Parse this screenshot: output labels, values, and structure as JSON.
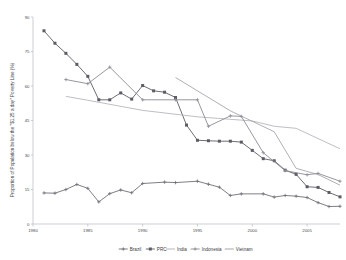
{
  "chart_data": {
    "type": "line",
    "title": "",
    "xlabel": "",
    "ylabel": "Proportion of Population below the \"$1.25 a day\" Poverty Line (%)",
    "xlim": [
      1980,
      2008
    ],
    "ylim": [
      0,
      90
    ],
    "xticks": [
      "1980",
      "1985",
      "1990",
      "1995",
      "2000",
      "2005"
    ],
    "xtick_values": [
      1980,
      1985,
      1990,
      1995,
      2000,
      2005
    ],
    "yticks": [
      "0",
      "15",
      "30",
      "45",
      "60",
      "75",
      "90"
    ],
    "ytick_values": [
      0,
      15,
      30,
      45,
      60,
      75,
      90
    ],
    "grid": false,
    "legend_position": "bottom",
    "series": [
      {
        "name": "Brazil",
        "color": "#6f6f78",
        "marker": "plus",
        "x": [
          1981,
          1982,
          1983,
          1984,
          1985,
          1986,
          1987,
          1988,
          1989,
          1990,
          1992,
          1993,
          1995,
          1996,
          1997,
          1998,
          1999,
          2001,
          2002,
          2003,
          2004,
          2005,
          2006,
          2007,
          2008
        ],
        "y": [
          13.5,
          13.4,
          15.0,
          17.2,
          15.5,
          9.6,
          13.2,
          14.8,
          13.6,
          17.6,
          18.2,
          18.0,
          18.6,
          17.3,
          16.0,
          12.4,
          13.1,
          13.1,
          11.7,
          12.4,
          12.1,
          11.5,
          9.3,
          7.6,
          7.7
        ]
      },
      {
        "name": "PRC",
        "color": "#5c5c66",
        "marker": "square",
        "x": [
          1981,
          1982,
          1983,
          1984,
          1985,
          1986,
          1987,
          1988,
          1989,
          1990,
          1991,
          1992,
          1993,
          1994,
          1995,
          1996,
          1997,
          1998,
          1999,
          2000,
          2001,
          2002,
          2003,
          2004,
          2005,
          2006,
          2007,
          2008
        ],
        "y": [
          84.0,
          78.6,
          74.2,
          69.4,
          64.2,
          54.0,
          54.0,
          57.0,
          54.3,
          60.2,
          57.9,
          57.3,
          55.0,
          43.0,
          36.4,
          36.2,
          36.0,
          36.0,
          35.6,
          32.0,
          28.4,
          27.5,
          23.4,
          21.6,
          16.2,
          15.9,
          13.7,
          11.8
        ]
      },
      {
        "name": "India",
        "color": "#adadb6",
        "marker": "none",
        "x": [
          1983,
          1985,
          1990,
          1995,
          2000,
          2002,
          2004,
          2008
        ],
        "y": [
          55.5,
          53.8,
          49.4,
          46.6,
          44.8,
          42.5,
          41.6,
          32.7
        ]
      },
      {
        "name": "Indonesia",
        "color": "#8b8b95",
        "marker": "plus",
        "x": [
          1983,
          1985,
          1987,
          1990,
          1993,
          1995,
          1996,
          1998,
          1999,
          2001,
          2003,
          2005,
          2006,
          2008
        ],
        "y": [
          62.8,
          61.0,
          68.2,
          54.0,
          54.0,
          54.0,
          42.5,
          47.0,
          46.8,
          31.0,
          23.2,
          21.4,
          22.0,
          18.6
        ]
      },
      {
        "name": "Vietnam",
        "color": "#9a9aa4",
        "marker": "none",
        "x": [
          1993,
          1998,
          2002,
          2004,
          2006,
          2008
        ],
        "y": [
          63.7,
          49.2,
          40.1,
          24.2,
          21.5,
          16.9
        ]
      }
    ]
  },
  "legend": {
    "items": [
      {
        "label": "Brazil",
        "marker": "plus",
        "color": "#6f6f78"
      },
      {
        "label": "PRC",
        "marker": "square",
        "color": "#5c5c66"
      },
      {
        "label": "India",
        "marker": "none",
        "color": "#adadb6"
      },
      {
        "label": "Indonesia",
        "marker": "plus",
        "color": "#8b8b95"
      },
      {
        "label": "Vietnam",
        "marker": "none",
        "color": "#9a9aa4"
      }
    ]
  }
}
